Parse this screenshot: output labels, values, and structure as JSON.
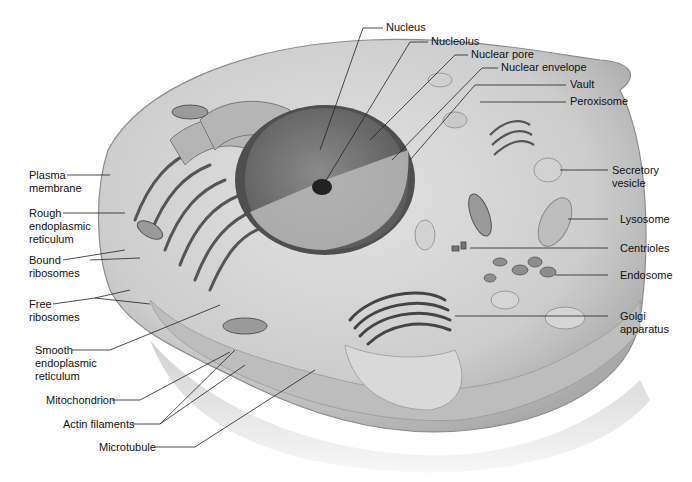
{
  "figure": {
    "colors": {
      "label_text": "#111111",
      "leader_line": "#222222",
      "cytoplasm": "#c9c9c9",
      "membrane": "#9a9a9a",
      "nucleus": "#6f6f6f"
    }
  },
  "labels": {
    "nucleus": "Nucleus",
    "nucleolus": "Nucleolus",
    "nuclear_pore": "Nuclear pore",
    "nuclear_envelope": "Nuclear envelope",
    "vault": "Vault",
    "peroxisome": "Peroxisome",
    "secretory_vesicle": "Secretory\nvesicle",
    "lysosome": "Lysosome",
    "centrioles": "Centrioles",
    "endosome": "Endosome",
    "golgi_apparatus": "Golgi\napparatus",
    "plasma_membrane": "Plasma\nmembrane",
    "rough_er": "Rough\nendoplasmic\nreticulum",
    "bound_ribosomes": "Bound\nribosomes",
    "free_ribosomes": "Free\nribosomes",
    "smooth_er": "Smooth\nendoplasmic\nreticulum",
    "mitochondrion": "Mitochondrion",
    "actin_filaments": "Actin filaments",
    "microtubule": "Microtubule"
  }
}
